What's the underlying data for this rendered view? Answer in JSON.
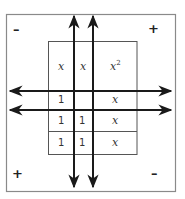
{
  "diagram": {
    "type": "algebra-tiles-multiplication-mat",
    "quadrant_signs": {
      "top_left": "–",
      "top_right": "+",
      "bottom_left": "+",
      "bottom_right": "–"
    },
    "tiles_top": [
      {
        "label": "x",
        "col": 0
      },
      {
        "label": "x",
        "col": 1
      },
      {
        "label": "x",
        "sup": "2",
        "col": 2
      }
    ],
    "tiles_bottom_rows": [
      [
        "1",
        "",
        "x"
      ],
      [
        "1",
        "1",
        "x"
      ],
      [
        "1",
        "1",
        "x"
      ]
    ],
    "colors": {
      "outer_border": "#8a8a8a",
      "inner_grid": "#555555",
      "axes": "#1a1a1a",
      "background": "#ffffff"
    }
  }
}
